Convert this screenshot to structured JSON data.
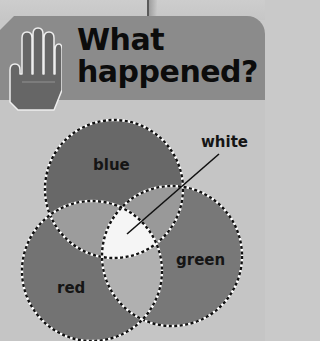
{
  "header": {
    "title_line1": "What",
    "title_line2": "happened?",
    "icon": "hand-icon"
  },
  "diagram": {
    "type": "venn",
    "sets": [
      {
        "name": "blue",
        "label": "blue"
      },
      {
        "name": "green",
        "label": "green"
      },
      {
        "name": "red",
        "label": "red"
      }
    ],
    "center_label": "white",
    "colors": {
      "header_band": "#8b8b8b",
      "background": "#c5c5c5",
      "blue": "#686868",
      "green": "#787878",
      "red": "#737373",
      "blue_green_overlap": "#999999",
      "blue_red_overlap": "#9c9c9c",
      "green_red_overlap": "#b0b0b0",
      "center": "#f5f5f5"
    }
  }
}
